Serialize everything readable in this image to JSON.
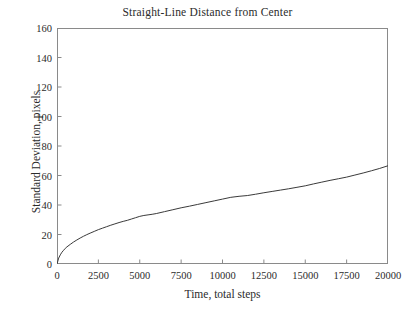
{
  "chart_data": {
    "type": "line",
    "title": "Straight-Line Distance from Center",
    "xlabel": "Time, total steps",
    "ylabel": "Standard Deviation, pixels",
    "xlim": [
      0,
      20000
    ],
    "ylim": [
      0,
      160
    ],
    "xticks": [
      0,
      2500,
      5000,
      7500,
      10000,
      12500,
      15000,
      17500,
      20000
    ],
    "xtick_labels": [
      "0",
      "2500",
      "5000",
      "7500",
      "10000",
      "12500",
      "15000",
      "17500",
      "20000"
    ],
    "yticks": [
      0,
      20,
      40,
      60,
      80,
      100,
      120,
      140,
      160
    ],
    "ytick_labels": [
      "0",
      "20",
      "40",
      "60",
      "80",
      "100",
      "120",
      "140",
      "160"
    ],
    "grid": false,
    "legend": false,
    "line_color": "#3a3a3a",
    "line_width": 1,
    "series": [
      {
        "name": "Standard Deviation",
        "x": [
          0,
          100,
          200,
          300,
          400,
          500,
          600,
          800,
          1000,
          1200,
          1400,
          1600,
          1800,
          2000,
          2250,
          2500,
          2750,
          3000,
          3250,
          3500,
          3750,
          4000,
          4250,
          4500,
          4750,
          5000,
          5250,
          5500,
          5750,
          6000,
          6500,
          7000,
          7500,
          8000,
          8500,
          9000,
          9500,
          10000,
          10500,
          11000,
          11500,
          12000,
          12500,
          13000,
          13500,
          14000,
          14500,
          15000,
          15500,
          16000,
          16500,
          17000,
          17500,
          18000,
          18500,
          19000,
          19500,
          20000
        ],
        "y": [
          0,
          4.0,
          6.2,
          8.0,
          9.3,
          10.6,
          11.6,
          13.3,
          14.9,
          16.3,
          17.6,
          18.8,
          19.9,
          20.9,
          22.1,
          23.3,
          24.3,
          25.3,
          26.3,
          27.2,
          28.1,
          28.9,
          29.6,
          30.5,
          31.4,
          32.3,
          32.9,
          33.3,
          33.7,
          34.2,
          35.5,
          36.8,
          38.1,
          39.2,
          40.4,
          41.6,
          42.8,
          44.0,
          45.2,
          45.9,
          46.4,
          47.3,
          48.3,
          49.2,
          50.1,
          51.0,
          52.0,
          53.0,
          54.3,
          55.5,
          56.7,
          57.8,
          58.9,
          60.3,
          61.7,
          63.2,
          64.8,
          66.6
        ]
      }
    ]
  }
}
